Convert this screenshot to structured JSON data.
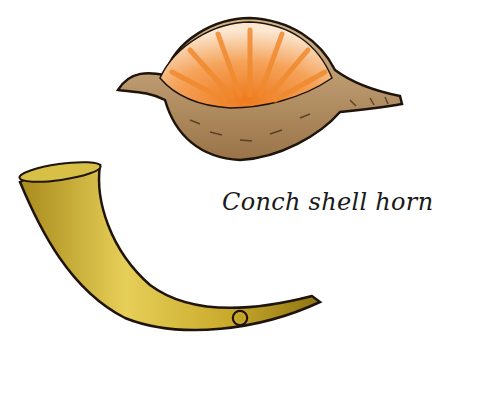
{
  "illustration": {
    "caption": "Conch shell horn",
    "objects": [
      {
        "name": "conch-shell",
        "colors": {
          "inner": "#f08a2e",
          "inner_light": "#fbe3c8",
          "outer": "#b58a5a",
          "outline": "#1e140c"
        }
      },
      {
        "name": "horn",
        "colors": {
          "body": "#c9a92a",
          "highlight": "#e8d35a",
          "shade": "#8f7414",
          "outline": "#1e140c"
        }
      }
    ],
    "background": "#ffffff"
  }
}
